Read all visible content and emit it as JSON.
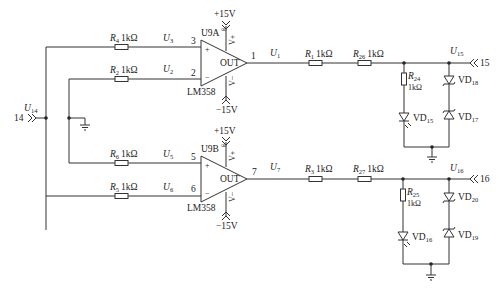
{
  "diagram": {
    "type": "circuit-schematic",
    "input_connector": {
      "pin": "14",
      "net": "U",
      "net_sub": "14"
    },
    "opamps": [
      {
        "id": "U9A",
        "part": "LM358",
        "supply_pos": "+15V",
        "supply_neg": "−15V",
        "pin_plus": "3",
        "pin_minus": "2",
        "pin_out": "1",
        "out_label": "OUT",
        "plus_sign": "+",
        "minus_sign": "−",
        "vplus": "V+",
        "vminus": "V−",
        "inf": "∞",
        "input_plus": {
          "res": "R",
          "res_sub": "4",
          "value": "1kΩ",
          "net": "U",
          "net_sub": "3"
        },
        "input_minus": {
          "res": "R",
          "res_sub": "2",
          "value": "1kΩ",
          "net": "U",
          "net_sub": "2"
        },
        "output_net": {
          "net": "U",
          "net_sub": "1"
        }
      },
      {
        "id": "U9B",
        "part": "LM358",
        "supply_pos": "+15V",
        "supply_neg": "−15V",
        "pin_plus": "5",
        "pin_minus": "6",
        "pin_out": "7",
        "out_label": "OUT",
        "plus_sign": "+",
        "minus_sign": "−",
        "vplus": "V+",
        "vminus": "V−",
        "inf": "∞",
        "input_plus": {
          "res": "R",
          "res_sub": "6",
          "value": "1kΩ",
          "net": "U",
          "net_sub": "5"
        },
        "input_minus": {
          "res": "R",
          "res_sub": "5",
          "value": "1kΩ",
          "net": "U",
          "net_sub": "6"
        },
        "output_net": {
          "net": "U",
          "net_sub": "7"
        }
      }
    ],
    "output_stages": [
      {
        "series_res_a": {
          "res": "R",
          "res_sub": "1",
          "value": "1kΩ"
        },
        "series_res_b": {
          "res": "R",
          "res_sub": "26",
          "value": "1kΩ"
        },
        "shunt_res": {
          "res": "R",
          "res_sub": "24",
          "value": "1kΩ"
        },
        "led": {
          "name": "VD",
          "sub": "15"
        },
        "zener_top": {
          "name": "VD",
          "sub": "18"
        },
        "zener_bottom": {
          "name": "VD",
          "sub": "17"
        },
        "out_net": {
          "net": "U",
          "net_sub": "15"
        },
        "out_pin": "15"
      },
      {
        "series_res_a": {
          "res": "R",
          "res_sub": "3",
          "value": "1kΩ"
        },
        "series_res_b": {
          "res": "R",
          "res_sub": "27",
          "value": "1kΩ"
        },
        "shunt_res": {
          "res": "R",
          "res_sub": "25",
          "value": "1kΩ"
        },
        "led": {
          "name": "VD",
          "sub": "16"
        },
        "zener_top": {
          "name": "VD",
          "sub": "20"
        },
        "zener_bottom": {
          "name": "VD",
          "sub": "19"
        },
        "out_net": {
          "net": "U",
          "net_sub": "16"
        },
        "out_pin": "16"
      }
    ]
  }
}
